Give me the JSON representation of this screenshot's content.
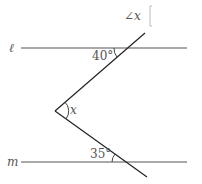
{
  "title": "∠x",
  "answer_box": "",
  "lines": {
    "l": {
      "label": "ℓ",
      "x1": 21,
      "x2": 187,
      "y": 48
    },
    "m": {
      "label": "m",
      "x1": 21,
      "x2": 187,
      "y": 162
    }
  },
  "vertex": {
    "x": 55,
    "y": 111,
    "label": "x"
  },
  "angles": {
    "top": {
      "label": "40°",
      "value": 40
    },
    "bottom": {
      "label": "35°",
      "value": 35
    }
  },
  "colors": {
    "line": "#555555",
    "ray": "#222222"
  }
}
